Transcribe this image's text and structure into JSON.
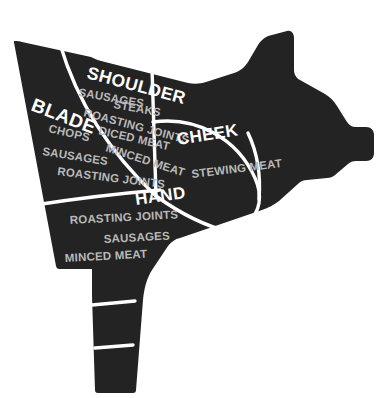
{
  "diagram": {
    "animal": "pig",
    "colors": {
      "body_fill": "#232323",
      "divider": "#ffffff",
      "background": "#ffffff",
      "header_text": "#ffffff",
      "cut_text": "#b9b9b9"
    }
  },
  "sections": [
    {
      "id": "blade",
      "label": "BLADE",
      "cuts": [
        "CHOPS",
        "SAUSAGES",
        "ROASTING JOINTS"
      ]
    },
    {
      "id": "shoulder",
      "label": "SHOULDER",
      "cuts": [
        "SAUSAGES",
        "STEAKS",
        "ROASTING JOINTS",
        "DICED MEAT",
        "MINCED MEAT"
      ]
    },
    {
      "id": "cheek",
      "label": "CHEEK",
      "cuts": [
        "STEWING MEAT"
      ]
    },
    {
      "id": "hand",
      "label": "HAND",
      "cuts": [
        "ROASTING JOINTS",
        "SAUSAGES",
        "MINCED MEAT"
      ]
    }
  ]
}
